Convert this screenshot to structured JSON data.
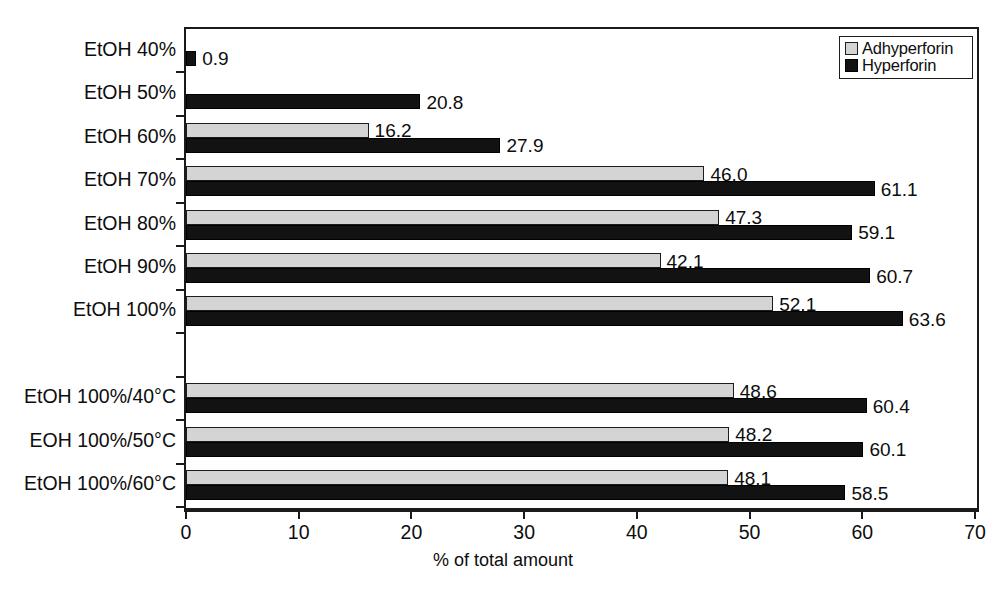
{
  "chart_data": {
    "type": "bar",
    "orientation": "horizontal",
    "title": "",
    "xlabel": "% of total amount",
    "ylabel": "",
    "xlim": [
      0,
      70
    ],
    "xticks": [
      0,
      10,
      20,
      30,
      40,
      50,
      60,
      70
    ],
    "grid": false,
    "legend_position": "top-right",
    "categories": [
      "EtOH 40%",
      "EtOH 50%",
      "EtOH 60%",
      "EtOH 70%",
      "EtOH 80%",
      "EtOH 90%",
      "EtOH 100%",
      "",
      "EtOH 100%/40°C",
      "EOH 100%/50°C",
      "EtOH 100%/60°C"
    ],
    "series": [
      {
        "name": "Adhyperforin",
        "color": "#d4d4d4",
        "values": [
          null,
          null,
          16.2,
          46.0,
          47.3,
          42.1,
          52.1,
          null,
          48.6,
          48.2,
          48.1
        ],
        "labels": [
          "",
          "",
          "16.2",
          "46.0",
          "47.3",
          "42.1",
          "52.1",
          "",
          "48.6",
          "48.2",
          "48.1"
        ]
      },
      {
        "name": "Hyperforin",
        "color": "#121212",
        "values": [
          0.9,
          20.8,
          27.9,
          61.1,
          59.1,
          60.7,
          63.6,
          null,
          60.4,
          60.1,
          58.5
        ],
        "labels": [
          "0.9",
          "20.8",
          "27.9",
          "61.1",
          "59.1",
          "60.7",
          "63.6",
          "",
          "60.4",
          "60.1",
          "58.5"
        ]
      }
    ]
  },
  "legend": {
    "items": [
      {
        "label": "Adhyperforin"
      },
      {
        "label": "Hyperforin"
      }
    ]
  },
  "axis": {
    "x_title": "% of total amount",
    "x_tick_labels": [
      "0",
      "10",
      "20",
      "30",
      "40",
      "50",
      "60",
      "70"
    ]
  }
}
